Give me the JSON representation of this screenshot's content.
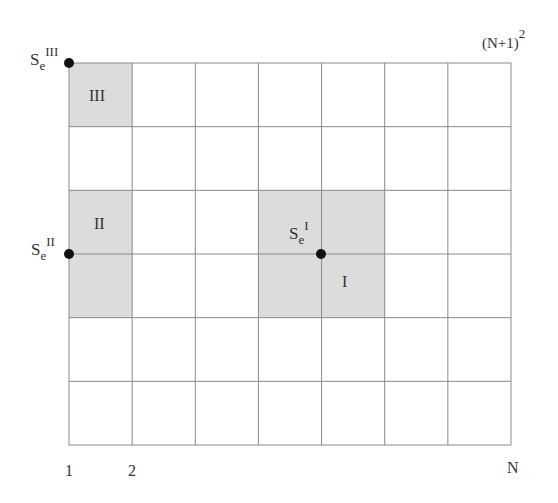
{
  "diagram": {
    "grid": {
      "columns": 7,
      "rows": 6,
      "left": 69,
      "top": 63,
      "right": 511,
      "bottom": 445,
      "line_color": "#8a8a8a",
      "fill_color": "#dcdcdc"
    },
    "shaded_regions": [
      {
        "id": "III",
        "label": "III",
        "col": 0,
        "row": 0,
        "col_span": 1,
        "row_span": 1
      },
      {
        "id": "II",
        "label": "II",
        "col": 0,
        "row": 2,
        "col_span": 1,
        "row_span": 2
      },
      {
        "id": "I",
        "label": "I",
        "col": 3,
        "row": 2,
        "col_span": 2,
        "row_span": 2
      }
    ],
    "points": [
      {
        "id": "SeIII",
        "base": "S",
        "sub": "e",
        "sup": "III",
        "x": 69,
        "y": 63
      },
      {
        "id": "SeII",
        "base": "S",
        "sub": "e",
        "sup": "II",
        "x": 69,
        "y": 254
      },
      {
        "id": "SeI",
        "base": "S",
        "sub": "e",
        "sup": "I",
        "x": 321,
        "y": 254
      }
    ],
    "axis_labels": {
      "x_first": "1",
      "x_second": "2",
      "x_last": "N",
      "corner": "(N+1)",
      "corner_exp": "2"
    },
    "region_labels": {
      "III": "III",
      "II": "II",
      "I": "I"
    },
    "point_labels": {
      "SeIII": {
        "base": "S",
        "sub": "e",
        "sup": "III"
      },
      "SeII": {
        "base": "S",
        "sub": "e",
        "sup": "II"
      },
      "SeI": {
        "base": "S",
        "sub": "e",
        "sup": "I"
      }
    }
  }
}
